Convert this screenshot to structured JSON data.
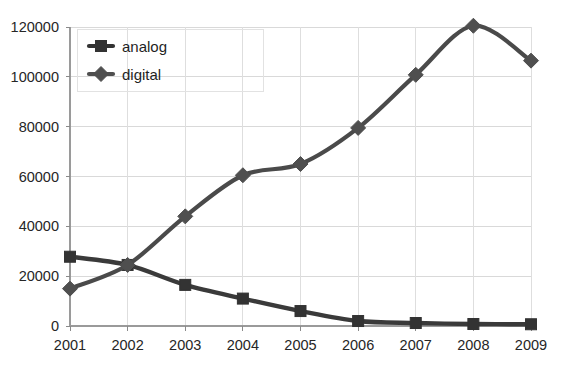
{
  "chart_data": {
    "type": "line",
    "title": "",
    "subtitle": "",
    "xlabel": "",
    "ylabel": "",
    "categories": [
      "2001",
      "2002",
      "2003",
      "2004",
      "2005",
      "2006",
      "2007",
      "2008",
      "2009"
    ],
    "series": [
      {
        "name": "analog",
        "marker": "square",
        "color": "#333333",
        "values": [
          27800,
          24500,
          16500,
          11000,
          6000,
          2000,
          1200,
          800,
          700
        ]
      },
      {
        "name": "digital",
        "marker": "diamond",
        "color": "#4f4f4f",
        "values": [
          15000,
          24500,
          44000,
          60500,
          65000,
          79500,
          100800,
          120500,
          106500
        ]
      }
    ],
    "ylim": [
      0,
      120000
    ],
    "xlim": [
      "2001",
      "2009"
    ],
    "yticks": [
      0,
      20000,
      40000,
      60000,
      80000,
      100000,
      120000
    ],
    "ytick_labels": [
      "0",
      "20000",
      "40000",
      "60000",
      "80000",
      "100000",
      "120000"
    ],
    "xtick_labels": [
      "2001",
      "2002",
      "2003",
      "2004",
      "2005",
      "2006",
      "2007",
      "2008",
      "2009"
    ],
    "grid": true,
    "grid_color": "#d9d9d9",
    "legend_position": "top-left-inside",
    "legend_entries": [
      "analog",
      "digital"
    ],
    "smoothed": true,
    "background": "#ffffff"
  },
  "legend": {
    "items": [
      {
        "label": "analog"
      },
      {
        "label": "digital"
      }
    ]
  },
  "axis": {
    "y_labels": [
      "120000",
      "100000",
      "80000",
      "60000",
      "40000",
      "20000",
      "0"
    ],
    "x_labels": [
      "2001",
      "2002",
      "2003",
      "2004",
      "2005",
      "2006",
      "2007",
      "2008",
      "2009"
    ]
  }
}
